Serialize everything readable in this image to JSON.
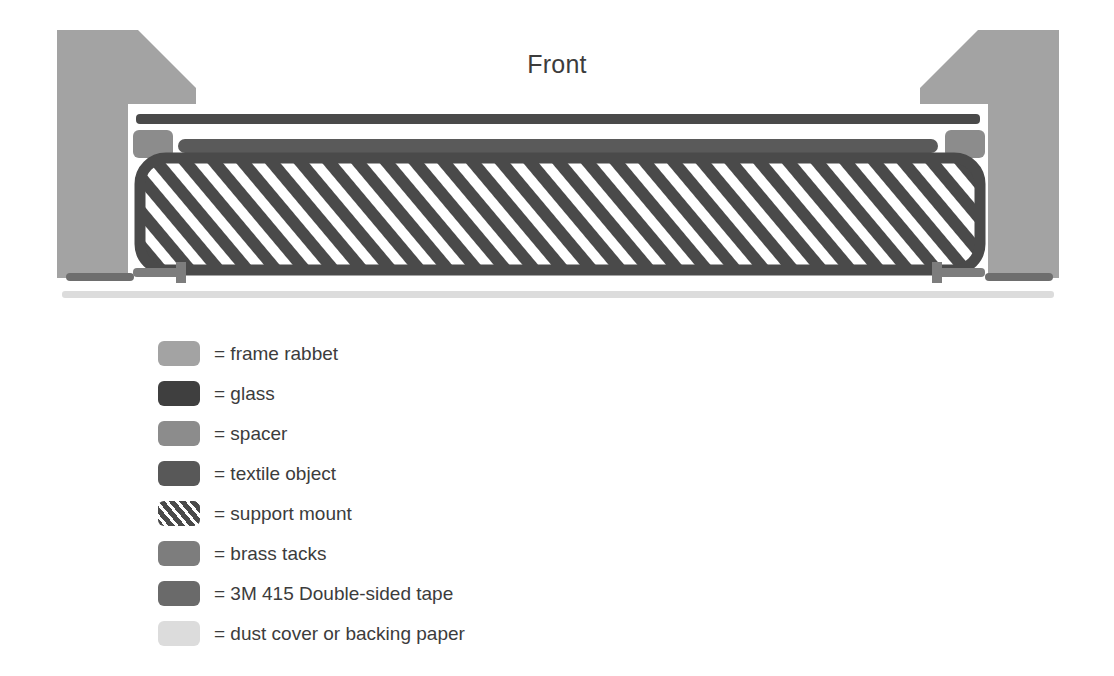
{
  "diagram": {
    "title": "Front",
    "type": "cross-section",
    "components": [
      {
        "name": "frame-rabbet-left",
        "color": "#a3a3a3"
      },
      {
        "name": "frame-rabbet-right",
        "color": "#a3a3a3"
      },
      {
        "name": "glass",
        "color": "#4a4a4a"
      },
      {
        "name": "spacer-left",
        "color": "#8c8c8c"
      },
      {
        "name": "spacer-right",
        "color": "#8c8c8c"
      },
      {
        "name": "textile-object",
        "color": "#5a5a5a"
      },
      {
        "name": "support-mount",
        "color": "#4a4a4a"
      },
      {
        "name": "brass-tack-left",
        "color": "#7d7d7d"
      },
      {
        "name": "brass-tack-right",
        "color": "#7d7d7d"
      },
      {
        "name": "tape-left",
        "color": "#6e6e6e"
      },
      {
        "name": "tape-right",
        "color": "#6e6e6e"
      },
      {
        "name": "dust-cover",
        "color": "#dcdcdc"
      }
    ]
  },
  "legend": {
    "items": [
      {
        "key": "frame-rabbet",
        "label": "= frame rabbet",
        "color": "#a3a3a3",
        "hatched": false
      },
      {
        "key": "glass",
        "label": "= glass",
        "color": "#3f3f3f",
        "hatched": false
      },
      {
        "key": "spacer",
        "label": "= spacer",
        "color": "#8c8c8c",
        "hatched": false
      },
      {
        "key": "textile",
        "label": "= textile object",
        "color": "#585858",
        "hatched": false
      },
      {
        "key": "support-mount",
        "label": "= support mount",
        "color": "#4a4a4a",
        "hatched": true
      },
      {
        "key": "brass-tacks",
        "label": "= brass tacks",
        "color": "#7d7d7d",
        "hatched": false
      },
      {
        "key": "tape",
        "label": "= 3M 415 Double-sided tape",
        "color": "#6a6a6a",
        "hatched": false
      },
      {
        "key": "dust-cover",
        "label": "= dust cover or backing paper",
        "color": "#dcdcdc",
        "hatched": false
      }
    ]
  },
  "colors": {
    "background": "#ffffff",
    "text": "#3c3c3c",
    "frame_rabbet": "#a3a3a3",
    "glass": "#4a4a4a",
    "spacer": "#8c8c8c",
    "textile": "#5a5a5a",
    "support_mount": "#4a4a4a",
    "brass_tacks": "#7d7d7d",
    "tape": "#6e6e6e",
    "dust_cover": "#dcdcdc"
  }
}
